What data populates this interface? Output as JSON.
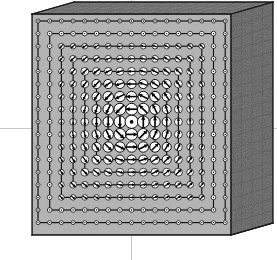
{
  "figure": {
    "domain": "scientific-visualization",
    "kind": "3d-block-vector-field",
    "title": "",
    "background_color": "#ffffff"
  },
  "canvas": {
    "width": 277,
    "height": 260
  },
  "colors": {
    "front_face": "#b2b2b2",
    "front_face_shade_dark": "#9a9a9a",
    "top_face": "#6e6e6e",
    "top_face_dark": "#545454",
    "right_face": "#5e5e5e",
    "right_face_dark": "#4a4a4a",
    "mesh_line": "#3a3a3a",
    "outline": "#1a1a1a",
    "contour_line": "#111111",
    "node_fill": "#ffffff",
    "node_stroke": "#111111",
    "arrow": "#000000",
    "axis_line": "#c9c9c9",
    "background": "#ffffff"
  },
  "geometry": {
    "front_face": {
      "x": 32,
      "y": 14,
      "width": 199,
      "height": 221,
      "label": "front-face"
    },
    "depth_vector": {
      "dx": 42,
      "dy": -12
    },
    "top_face_rows": 3,
    "right_face_cols": 4,
    "right_face_rows": 18
  },
  "grid": {
    "cols": 17,
    "rows": 17,
    "origin_x": 38,
    "origin_y": 21,
    "step_x": 11.7,
    "step_y": 12.6,
    "node_min_radius": 2.0,
    "node_max_radius": 6.6,
    "description": "17 x 17 array of circular node markers; marker radius grows toward the centre of the block"
  },
  "vector_field": {
    "type": "circulating",
    "center_col": 8,
    "center_row": 8,
    "rotation": "clockwise",
    "glyph": "filled-triangle-arrowhead",
    "description": "Arrow glyphs inside the node circles rotate clockwise about the block centre; magnitude peaks on the inner rings and decays outward"
  },
  "contours": {
    "shape": "nested-rectangles",
    "count": 8,
    "levels": [
      {
        "name": "contour-ring-1",
        "inset_cols": 0,
        "label": ""
      },
      {
        "name": "contour-ring-2",
        "inset_cols": 1,
        "label": ""
      },
      {
        "name": "contour-ring-3",
        "inset_cols": 2,
        "label": ""
      },
      {
        "name": "contour-ring-4",
        "inset_cols": 3,
        "label": ""
      },
      {
        "name": "contour-ring-5",
        "inset_cols": 4,
        "label": ""
      },
      {
        "name": "contour-ring-6",
        "inset_cols": 5,
        "label": ""
      },
      {
        "name": "contour-ring-7",
        "inset_cols": 6,
        "label": ""
      },
      {
        "name": "contour-ring-8",
        "inset_cols": 7,
        "label": ""
      }
    ]
  },
  "axes": {
    "horizontal": {
      "name": "horizontal-axis-line",
      "y": 128,
      "visible": true
    },
    "vertical": {
      "name": "vertical-axis-line",
      "x": 131,
      "visible": true
    }
  },
  "labels": {
    "x_axis": "",
    "y_axis": "",
    "z_axis": "",
    "caption": ""
  }
}
